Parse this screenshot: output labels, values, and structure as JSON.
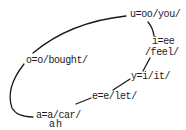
{
  "diagram": {
    "type": "vowel-cycle",
    "line_color": "#1a1a1a",
    "nodes": [
      {
        "id": "u",
        "lines": [
          "u=oo/you/"
        ]
      },
      {
        "id": "i",
        "lines": [
          "i=ee",
          "/feel/"
        ]
      },
      {
        "id": "y",
        "lines": [
          "y=i/it/"
        ]
      },
      {
        "id": "e",
        "lines": [
          "e=e/let/"
        ]
      },
      {
        "id": "a",
        "lines": [
          "a=a/car/",
          "ah"
        ]
      },
      {
        "id": "o",
        "lines": [
          "o=o/bought/"
        ]
      }
    ],
    "edges": [
      [
        "o",
        "u"
      ],
      [
        "u",
        "i"
      ],
      [
        "i",
        "y"
      ],
      [
        "y",
        "e"
      ],
      [
        "e",
        "a"
      ],
      [
        "a",
        "o"
      ]
    ]
  }
}
